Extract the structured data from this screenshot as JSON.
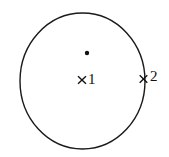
{
  "figure": {
    "type": "geometry-diagram",
    "background_color": "#ffffff",
    "stroke_color": "#1a1a1a",
    "shapes": {
      "circle": {
        "name": "circle-outline",
        "center_x": 82.5,
        "center_y": 81,
        "radius_x": 62.5,
        "radius_y": 68,
        "stroke_width": 1.4,
        "fill": "none"
      },
      "dot": {
        "name": "center-dot",
        "x": 87,
        "y": 53,
        "radius": 2.2,
        "fill": "#111111"
      },
      "markers": [
        {
          "name": "cross-marker-1",
          "glyph": "x",
          "x": 82,
          "y": 80,
          "size": 9,
          "stroke_width": 1.3
        },
        {
          "name": "cross-marker-2",
          "glyph": "x",
          "x": 143.5,
          "y": 79,
          "size": 9,
          "stroke_width": 1.3
        }
      ]
    },
    "labels": [
      {
        "id": "label-1",
        "text": "1",
        "x": 88,
        "y": 72
      },
      {
        "id": "label-2",
        "text": "2",
        "x": 150,
        "y": 69
      }
    ]
  }
}
